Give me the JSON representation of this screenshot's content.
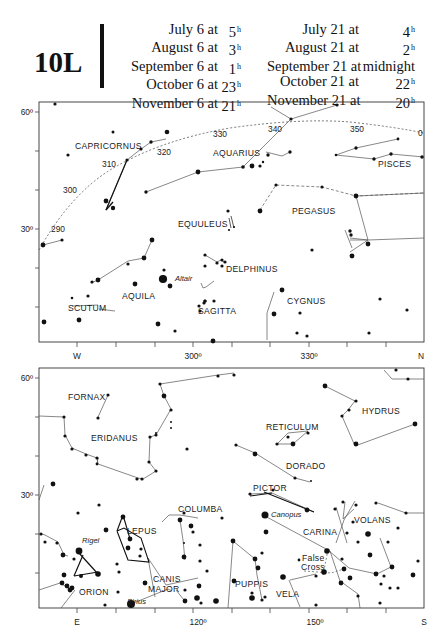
{
  "header": {
    "plate_id": "10L",
    "left_column": [
      {
        "date": "July 6 at",
        "hour": "5",
        "unit": "h"
      },
      {
        "date": "August 6 at",
        "hour": "3",
        "unit": "h"
      },
      {
        "date": "September 6 at",
        "hour": "1",
        "unit": "h"
      },
      {
        "date": "October 6 at",
        "hour": "23",
        "unit": "h"
      },
      {
        "date": "November 6 at",
        "hour": "21",
        "unit": "h"
      }
    ],
    "right_column": [
      {
        "date": "July 21 at",
        "hour": "4",
        "unit": "h"
      },
      {
        "date": "August 21 at",
        "hour": "2",
        "unit": "h"
      },
      {
        "date": "September 21 at",
        "hour": "midnight",
        "unit": ""
      },
      {
        "date": "October 21 at",
        "hour": "22",
        "unit": "h"
      },
      {
        "date": "November 21 at",
        "hour": "20",
        "unit": "h"
      }
    ]
  },
  "charts": {
    "north": {
      "frame": {
        "x": 39,
        "y": 102,
        "w": 385,
        "h": 240
      },
      "y_labels": [
        {
          "text": "60º",
          "y": 112
        },
        {
          "text": "30º",
          "y": 229
        }
      ],
      "x_labels": [
        {
          "text": "W",
          "x": 77
        },
        {
          "text": "300º",
          "x": 193
        },
        {
          "text": "330º",
          "x": 309
        },
        {
          "text": "N",
          "x": 421
        }
      ],
      "ecliptic_labels": [
        {
          "text": "290",
          "x": 51,
          "y": 232
        },
        {
          "text": "300",
          "x": 63,
          "y": 193
        },
        {
          "text": "310",
          "x": 102,
          "y": 167
        },
        {
          "text": "320",
          "x": 157,
          "y": 155
        },
        {
          "text": "330",
          "x": 213,
          "y": 137
        },
        {
          "text": "340",
          "x": 268,
          "y": 132
        },
        {
          "text": "350",
          "x": 350,
          "y": 132
        },
        {
          "text": "0",
          "x": 418,
          "y": 136
        }
      ],
      "constellations": [
        {
          "name": "CAPRICORNUS",
          "x": 75,
          "y": 149
        },
        {
          "name": "AQUARIUS",
          "x": 213,
          "y": 156
        },
        {
          "name": "PISCES",
          "x": 378,
          "y": 167
        },
        {
          "name": "EQUULEUS",
          "x": 178,
          "y": 227
        },
        {
          "name": "PEGASUS",
          "x": 292,
          "y": 214
        },
        {
          "name": "DELPHINUS",
          "x": 226,
          "y": 272
        },
        {
          "name": "AQUILA",
          "x": 122,
          "y": 299
        },
        {
          "name": "SCUTUM",
          "x": 68,
          "y": 311
        },
        {
          "name": "SAGITTA",
          "x": 198,
          "y": 314
        },
        {
          "name": "CYGNUS",
          "x": 287,
          "y": 304
        }
      ],
      "named_stars": [
        {
          "name": "Altair",
          "x": 175,
          "y": 281
        }
      ]
    },
    "south": {
      "frame": {
        "x": 39,
        "y": 368,
        "w": 385,
        "h": 240
      },
      "y_labels": [
        {
          "text": "60º",
          "y": 378
        },
        {
          "text": "30º",
          "y": 495
        }
      ],
      "x_labels": [
        {
          "text": "E",
          "x": 77
        },
        {
          "text": "120º",
          "x": 198
        },
        {
          "text": "150º",
          "x": 315
        },
        {
          "text": "S",
          "x": 424
        }
      ],
      "constellations": [
        {
          "name": "FORNAX",
          "x": 68,
          "y": 400
        },
        {
          "name": "ERIDANUS",
          "x": 91,
          "y": 441
        },
        {
          "name": "RETICULUM",
          "x": 266,
          "y": 430
        },
        {
          "name": "HYDRUS",
          "x": 362,
          "y": 414
        },
        {
          "name": "DORADO",
          "x": 286,
          "y": 469
        },
        {
          "name": "PICTOR",
          "x": 253,
          "y": 491
        },
        {
          "name": "COLUMBA",
          "x": 178,
          "y": 512
        },
        {
          "name": "LEPUS",
          "x": 127,
          "y": 534
        },
        {
          "name": "CARINA",
          "x": 303,
          "y": 535
        },
        {
          "name": "VOLANS",
          "x": 354,
          "y": 523
        },
        {
          "name": "CANIS",
          "x": 153,
          "y": 582
        },
        {
          "name": "MAJOR",
          "x": 148,
          "y": 592
        },
        {
          "name": "ORION",
          "x": 79,
          "y": 595
        },
        {
          "name": "PUPPIS",
          "x": 235,
          "y": 587
        },
        {
          "name": "VELA",
          "x": 276,
          "y": 597
        },
        {
          "name": "False",
          "x": 302,
          "y": 561
        },
        {
          "name": "Cross",
          "x": 301,
          "y": 570
        }
      ],
      "named_stars": [
        {
          "name": "Rigel",
          "x": 82,
          "y": 543
        },
        {
          "name": "Canopus",
          "x": 271,
          "y": 517
        },
        {
          "name": "Sirius",
          "x": 127,
          "y": 604
        }
      ]
    }
  }
}
